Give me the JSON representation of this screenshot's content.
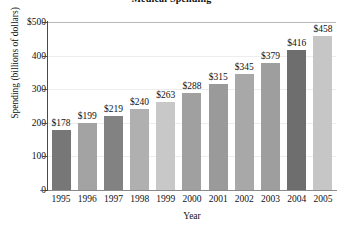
{
  "chart_data": {
    "type": "bar",
    "title": "Medical Spending",
    "xlabel": "Year",
    "ylabel": "Spending (billions of dollars)",
    "categories": [
      "1995",
      "1996",
      "1997",
      "1998",
      "1999",
      "2000",
      "2001",
      "2002",
      "2003",
      "2004",
      "2005"
    ],
    "values": [
      178,
      199,
      219,
      240,
      263,
      288,
      315,
      345,
      379,
      416,
      458
    ],
    "data_labels": [
      "$178",
      "$199",
      "$219",
      "$240",
      "$263",
      "$288",
      "$315",
      "$345",
      "$379",
      "$416",
      "$458"
    ],
    "bar_colors": [
      "#777777",
      "#a3a3a3",
      "#828282",
      "#b0b0b0",
      "#c8c8c8",
      "#a0a0a0",
      "#9a9a9a",
      "#a8a8a8",
      "#9e9e9e",
      "#6e6e6e",
      "#c6c6c6"
    ],
    "ylim": [
      0,
      500
    ],
    "ytick_values": [
      500,
      400,
      300,
      200,
      100,
      0
    ],
    "ytick_labels": [
      "$500",
      "400",
      "300",
      "200",
      "100",
      "0"
    ],
    "grid": true,
    "legend": "none"
  }
}
